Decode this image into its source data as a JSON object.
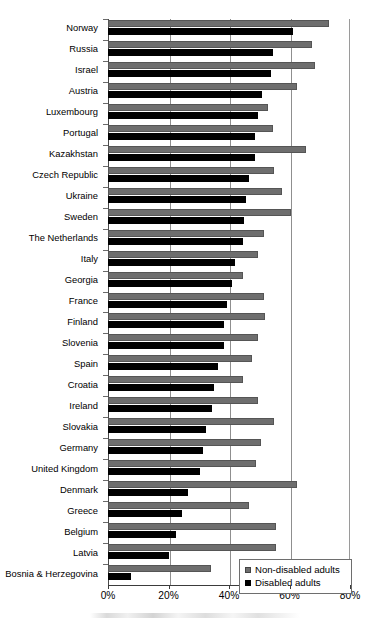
{
  "chart_data": {
    "type": "bar",
    "orientation": "horizontal",
    "title": "",
    "xlabel": "",
    "ylabel": "",
    "xlim": [
      0,
      80
    ],
    "xticks": [
      0,
      20,
      40,
      60,
      80
    ],
    "xtick_labels": [
      "0%",
      "20%",
      "40%",
      "60%",
      "80%"
    ],
    "grid": true,
    "legend_position": "bottom-right",
    "legend": [
      "Non-disabled adults",
      "Disabled adults"
    ],
    "colors": {
      "non_disabled": "#6e6e6e",
      "disabled": "#000000",
      "axis": "#3b3b3b",
      "grid": "#8f8f8f",
      "background": "#ffffff"
    },
    "categories": [
      "Norway",
      "Russia",
      "Israel",
      "Austria",
      "Luxembourg",
      "Portugal",
      "Kazakhstan",
      "Czech Republic",
      "Ukraine",
      "Sweden",
      "The Netherlands",
      "Italy",
      "Georgia",
      "France",
      "Finland",
      "Slovenia",
      "Spain",
      "Croatia",
      "Ireland",
      "Slovakia",
      "Germany",
      "United Kingdom",
      "Denmark",
      "Greece",
      "Belgium",
      "Latvia",
      "Bosnia & Herzegovina"
    ],
    "series": [
      {
        "name": "Non-disabled adults",
        "color": "#6e6e6e",
        "values": [
          73.0,
          67.5,
          68.5,
          62.5,
          53.0,
          54.5,
          65.5,
          55.0,
          57.5,
          60.5,
          51.5,
          49.5,
          44.5,
          51.5,
          52.0,
          49.5,
          47.5,
          44.5,
          49.5,
          55.0,
          50.5,
          49.0,
          62.5,
          46.5,
          55.5,
          55.5,
          34.0
        ]
      },
      {
        "name": "Disabled adults",
        "color": "#000000",
        "values": [
          61.0,
          54.5,
          54.0,
          51.0,
          49.5,
          48.5,
          48.5,
          46.5,
          45.5,
          45.0,
          44.5,
          42.0,
          41.0,
          39.5,
          38.5,
          38.5,
          36.5,
          35.0,
          34.5,
          32.5,
          31.5,
          30.5,
          26.5,
          24.5,
          22.5,
          20.0,
          7.5
        ]
      }
    ]
  },
  "legend": {
    "items": [
      {
        "label": "Non-disabled adults",
        "swatch": "gray"
      },
      {
        "label": "Disabled adults",
        "swatch": "black"
      }
    ]
  }
}
